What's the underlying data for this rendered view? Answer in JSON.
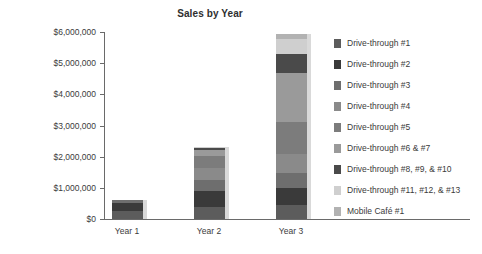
{
  "chart_data": {
    "type": "bar",
    "subtype": "stacked-bar",
    "title": "Sales by Year",
    "xlabel": "",
    "ylabel": "",
    "categories": [
      "Year 1",
      "Year 2",
      "Year 3"
    ],
    "ylim": [
      0,
      6000000
    ],
    "ytick_values": [
      0,
      1000000,
      2000000,
      3000000,
      4000000,
      5000000,
      6000000
    ],
    "ytick_labels": [
      "$0",
      "$1,000,000",
      "$2,000,000",
      "$3,000,000",
      "$4,000,000",
      "$5,000,000",
      "$6,000,000"
    ],
    "grid": false,
    "legend_position": "right",
    "series": [
      {
        "name": "Drive-through #1",
        "color": "#5c5c5c",
        "values": [
          250000,
          400000,
          450000
        ]
      },
      {
        "name": "Drive-through #2",
        "color": "#3a3a3a",
        "values": [
          250000,
          500000,
          560000
        ]
      },
      {
        "name": "Drive-through #3",
        "color": "#6e6e6e",
        "values": [
          100000,
          350000,
          480000
        ]
      },
      {
        "name": "Drive-through #4",
        "color": "#8a8a8a",
        "values": [
          0,
          400000,
          580000
        ]
      },
      {
        "name": "Drive-through #5",
        "color": "#7c7c7c",
        "values": [
          0,
          380000,
          1050000
        ]
      },
      {
        "name": "Drive-through #6 & #7",
        "color": "#9a9a9a",
        "values": [
          0,
          180000,
          1580000
        ]
      },
      {
        "name": "Drive-through #8, #9, & #10",
        "color": "#4a4a4a",
        "values": [
          0,
          60000,
          580000
        ]
      },
      {
        "name": "Drive-through #11, #12, & #13",
        "color": "#cfcfcf",
        "values": [
          0,
          30000,
          480000
        ]
      },
      {
        "name": "Mobile Café #1",
        "color": "#b2b2b2",
        "values": [
          0,
          0,
          190000
        ]
      }
    ],
    "totals": [
      600000,
      2300000,
      5950000
    ],
    "colors": {
      "axis": "#6a6a6a",
      "text": "#3b3b3b",
      "background": "#ffffff",
      "bar_shadow": "#d9d9d9"
    }
  }
}
